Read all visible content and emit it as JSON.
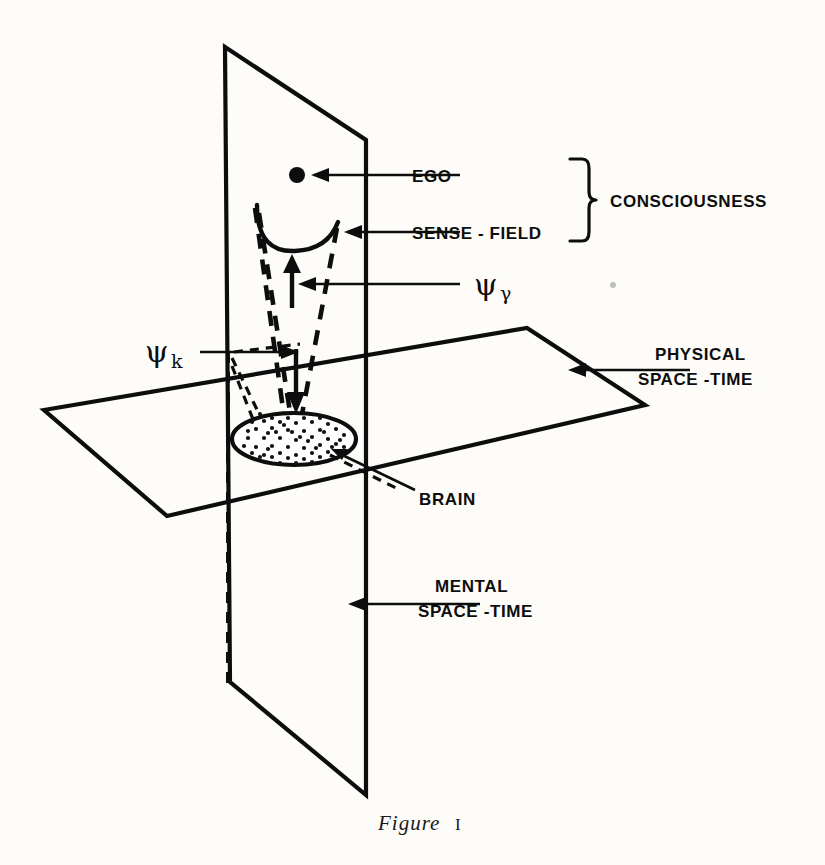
{
  "figure": {
    "caption_word": "Figure",
    "caption_number": "I",
    "background_color": "#fdfcf9",
    "ink_color": "#0d0d0d"
  },
  "labels": {
    "ego": "EGO",
    "sense_field": "SENSE - FIELD",
    "consciousness": "CONSCIOUSNESS",
    "brain": "BRAIN",
    "physical_line1": "PHYSICAL",
    "physical_line2": "SPACE -TIME",
    "mental_line1": "MENTAL",
    "mental_line2": "SPACE -TIME",
    "psi_gamma_symbol": "ψ",
    "psi_gamma_sub": "γ",
    "psi_k_symbol": "ψ",
    "psi_k_sub": "k"
  },
  "diagram": {
    "planes": [
      {
        "name": "mental-space-time-plane",
        "orientation": "vertical",
        "points": "225,47 366,140 366,795 230,682"
      },
      {
        "name": "physical-space-time-plane",
        "orientation": "horizontal",
        "points": "44,410 527,328 645,405 167,516"
      }
    ],
    "ego_point": {
      "cx": 297,
      "cy": 175,
      "r": 8
    },
    "brain_ellipse": {
      "cx": 294,
      "cy": 439,
      "rx": 62,
      "ry": 26
    },
    "sense_field_curve": "M 258,208 C 259,243 275,252 296,250 C 318,248 330,240 337,224",
    "hidden_vertical_edge": "M 228,355 L 228,690",
    "psi_gamma_arrow": {
      "x": 292,
      "y_tail": 307,
      "y_head": 257
    },
    "psi_k_arrow": {
      "x": 296,
      "y_tail": 349,
      "y_head": 412
    }
  },
  "leaders": [
    {
      "name": "ego-leader",
      "from_x": 460,
      "to_x": 322,
      "y": 175
    },
    {
      "name": "sense-field-leader",
      "from_x": 460,
      "to_x": 348,
      "y": 232
    },
    {
      "name": "psi-gamma-leader",
      "from_x": 460,
      "to_x": 300,
      "y": 284
    },
    {
      "name": "psi-k-leader",
      "from_x": 200,
      "to_x": 297,
      "y": 352
    },
    {
      "name": "physical-leader",
      "from_x": 690,
      "to_x": 568,
      "y": 370
    },
    {
      "name": "mental-leader",
      "from_x": 480,
      "to_x": 348,
      "y": 604
    },
    {
      "name": "brain-leader",
      "from_x": 415,
      "to_x": 340,
      "y": 455
    }
  ],
  "artifacts": {
    "speck_note": "small ink speck right of psi-gamma label"
  }
}
